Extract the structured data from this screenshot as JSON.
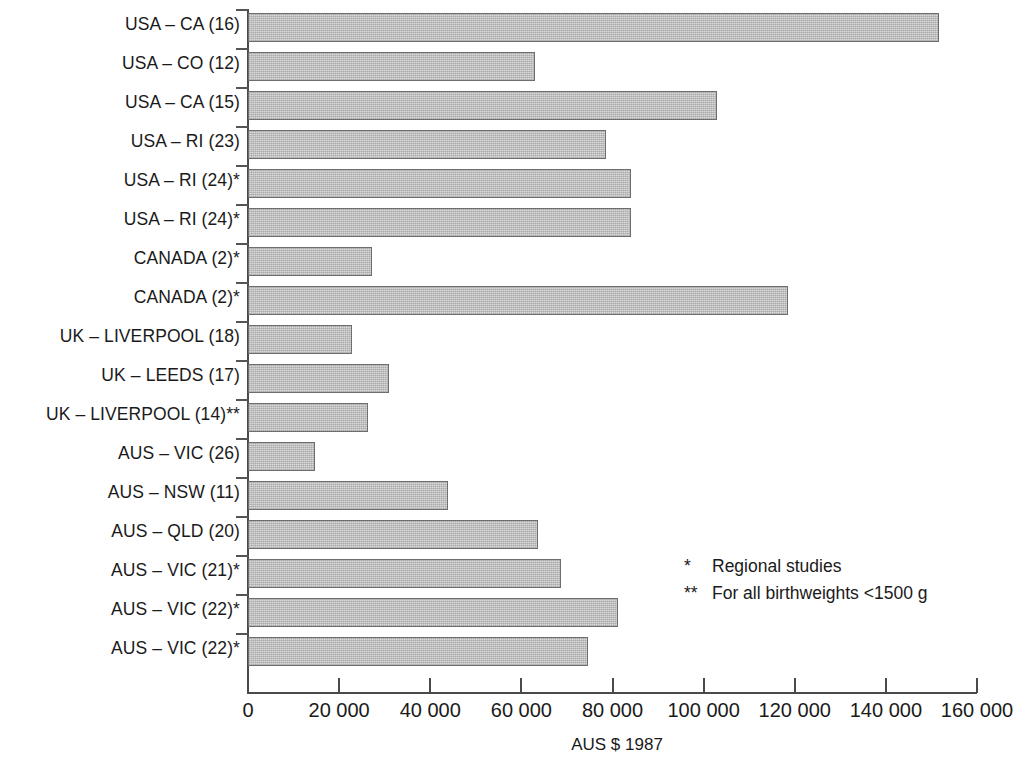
{
  "chart_data": {
    "type": "bar",
    "orientation": "horizontal",
    "title": "",
    "subtitle": "",
    "xlabel": "AUS $ 1987",
    "ylabel": "",
    "xlim": [
      0,
      160000
    ],
    "grid": false,
    "legend_position": "inside-right",
    "x_tick_labels": [
      "0",
      "20 000",
      "40 000",
      "60 000",
      "80 000",
      "100 000",
      "120 000",
      "140 000",
      "160 000"
    ],
    "x_tick_values": [
      0,
      20000,
      40000,
      60000,
      80000,
      100000,
      120000,
      140000,
      160000
    ],
    "categories": [
      "USA – CA (16)",
      "USA – CO (12)",
      "USA – CA (15)",
      "USA – RI (23)",
      "USA – RI (24)*",
      "USA – RI (24)*",
      "CANADA (2)*",
      "CANADA (2)*",
      "UK – LIVERPOOL (18)",
      "UK – LEEDS (17)",
      "UK – LIVERPOOL (14)**",
      "AUS – VIC (26)",
      "AUS – NSW (11)",
      "AUS – QLD (20)",
      "AUS – VIC (21)*",
      "AUS – VIC (22)*",
      "AUS – VIC (22)*"
    ],
    "values": [
      151600,
      63000,
      103000,
      78500,
      84000,
      84000,
      27200,
      118500,
      22900,
      30900,
      26400,
      14700,
      44000,
      63700,
      68800,
      81300,
      74700
    ],
    "annotations": [
      {
        "mark": "*",
        "text": "Regional studies"
      },
      {
        "mark": "**",
        "text": "For all birthweights <1500 g"
      }
    ],
    "colors": {
      "bar_fill": "#d9d9d9",
      "bar_stroke": "#6e6e6e",
      "axis": "#4a4a4a",
      "text": "#1a1a1a"
    }
  }
}
